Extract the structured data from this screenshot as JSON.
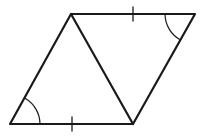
{
  "diagram": {
    "type": "parallelogram-with-diagonal",
    "stroke_color": "#1a1a1a",
    "background": "#ffffff",
    "vertices": {
      "top_left": [
        71,
        14
      ],
      "top_right": [
        195,
        14
      ],
      "bottom_right": [
        133,
        124
      ],
      "bottom_left": [
        10,
        124
      ]
    },
    "tick_marks": [
      {
        "side": "top",
        "position": [
          133,
          14
        ],
        "count": 1
      },
      {
        "side": "bottom",
        "position": [
          72,
          124
        ],
        "count": 1
      }
    ],
    "angle_marks": [
      {
        "vertex": "bottom_left",
        "arcs": 1
      },
      {
        "vertex": "top_right",
        "arcs": 1
      }
    ],
    "diagonal": {
      "from": "top_left",
      "to": "bottom_right"
    }
  }
}
